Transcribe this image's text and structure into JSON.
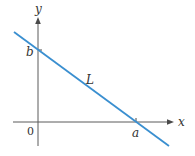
{
  "diagram": {
    "colors": {
      "line": "#3a8fd0",
      "axes": "#5a5a5a",
      "text": "#333333",
      "background": "#ffffff"
    },
    "axes": {
      "x_label": "x",
      "y_label": "y",
      "origin_label": "0"
    },
    "line": {
      "label": "L",
      "y_intercept_label": "b",
      "x_intercept_label": "a"
    }
  }
}
